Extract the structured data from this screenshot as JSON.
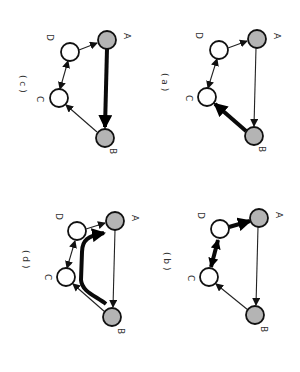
{
  "figure": {
    "orientation": "rotated 90 degrees clockwise",
    "node_colors": {
      "shaded": "#b4b4b4",
      "unshaded": "#ffffff"
    },
    "panels": [
      {
        "id": "a",
        "label": "( a )",
        "nodes": {
          "A": "shaded",
          "B": "shaded",
          "C": "unshaded",
          "D": "unshaded"
        },
        "edges": [
          {
            "from": "A",
            "to": "B",
            "style": "thin"
          },
          {
            "from": "B",
            "to": "C",
            "style": "thick"
          },
          {
            "from": "C",
            "to": "D",
            "style": "thin",
            "bidirectional": true
          },
          {
            "from": "D",
            "to": "A",
            "style": "thin"
          }
        ]
      },
      {
        "id": "b",
        "label": "( b )",
        "nodes": {
          "A": "shaded",
          "B": "shaded",
          "C": "unshaded",
          "D": "unshaded"
        },
        "edges": [
          {
            "from": "A",
            "to": "B",
            "style": "thin"
          },
          {
            "from": "B",
            "to": "C",
            "style": "thin"
          },
          {
            "from": "C",
            "to": "D",
            "style": "thick",
            "bidirectional": true
          },
          {
            "from": "D",
            "to": "A",
            "style": "thick"
          }
        ]
      },
      {
        "id": "c",
        "label": "( c )",
        "nodes": {
          "A": "shaded",
          "B": "shaded",
          "C": "unshaded",
          "D": "unshaded"
        },
        "edges": [
          {
            "from": "A",
            "to": "B",
            "style": "thick"
          },
          {
            "from": "B",
            "to": "C",
            "style": "thin"
          },
          {
            "from": "C",
            "to": "D",
            "style": "thin",
            "bidirectional": true
          },
          {
            "from": "D",
            "to": "A",
            "style": "thin"
          }
        ]
      },
      {
        "id": "d",
        "label": "( d )",
        "nodes": {
          "A": "shaded",
          "B": "shaded",
          "C": "unshaded",
          "D": "unshaded"
        },
        "edges": [
          {
            "from": "A",
            "to": "B",
            "style": "thin"
          },
          {
            "from": "B",
            "to": "C",
            "style": "thin"
          },
          {
            "from": "C",
            "to": "D",
            "style": "thin",
            "bidirectional": true
          },
          {
            "from": "D",
            "to": "A",
            "style": "thin"
          },
          {
            "from": "B",
            "to": "A",
            "style": "thick-curved",
            "via": "C, D"
          }
        ]
      }
    ],
    "node_labels": {
      "A": "A",
      "B": "B",
      "C": "C",
      "D": "D"
    }
  }
}
